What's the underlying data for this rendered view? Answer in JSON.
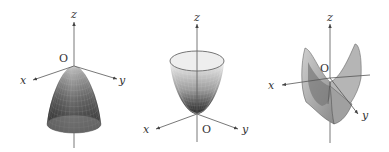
{
  "figure": {
    "panels": [
      {
        "name": "downward-paraboloid",
        "surface": "elliptic paraboloid opening downward",
        "labels": {
          "z": "z",
          "x": "x",
          "y": "y",
          "origin": "O"
        }
      },
      {
        "name": "upward-paraboloid",
        "surface": "elliptic paraboloid opening upward",
        "labels": {
          "z": "z",
          "x": "x",
          "y": "y",
          "origin": "O"
        }
      },
      {
        "name": "hyperbolic-paraboloid",
        "surface": "hyperbolic paraboloid (saddle)",
        "labels": {
          "z": "z",
          "x": "x",
          "y": "y",
          "origin": "O"
        }
      }
    ],
    "colors": {
      "axis": "#555555",
      "surface_dark": "#2a2a2a",
      "surface_light": "#e6e6e6",
      "text": "#333333"
    }
  }
}
